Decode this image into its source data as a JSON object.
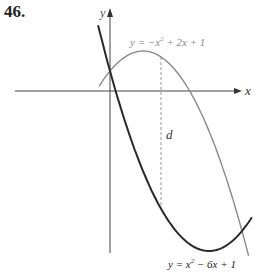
{
  "problem": {
    "number": "46."
  },
  "axes": {
    "x_label": "x",
    "y_label": "y",
    "origin_px": [
      110,
      91
    ],
    "scale_px_per_unit": {
      "x": 33,
      "y": 20
    }
  },
  "curves": [
    {
      "id": "parabola-down",
      "equation": "y = −x² + 2x + 1",
      "label_parts": {
        "lhs": "y = −x",
        "exp": "2",
        "rhs": " + 2x + 1"
      },
      "color": "#8a8a8a",
      "x_range": [
        -0.33,
        4.2
      ]
    },
    {
      "id": "parabola-up",
      "equation": "y = x² − 6x + 1",
      "label_parts": {
        "lhs": "y = x",
        "exp": "2",
        "rhs": " − 6x + 1"
      },
      "color": "#2a2a2a",
      "x_range": [
        -0.36,
        4.3
      ]
    }
  ],
  "distance_segment": {
    "label": "d",
    "x_value": 1.55,
    "style": "dashed",
    "color": "#999999"
  },
  "colors": {
    "axis": "#444444",
    "label_gray": "#8a8a8a",
    "label_dark": "#222222"
  }
}
